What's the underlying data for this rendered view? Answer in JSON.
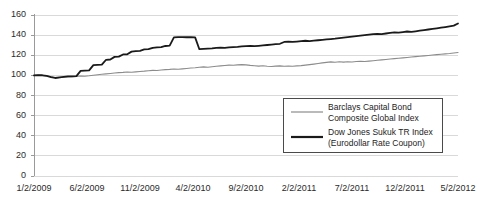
{
  "chart_data": {
    "type": "line",
    "title": "",
    "subtitle": "",
    "xlabel": "",
    "ylabel": "",
    "ylim": [
      0,
      160
    ],
    "ytick_labels": [
      "160",
      "140",
      "120",
      "100",
      "80",
      "60",
      "40",
      "20",
      "0"
    ],
    "ytick_values": [
      160,
      140,
      120,
      100,
      80,
      60,
      40,
      20,
      0
    ],
    "grid": true,
    "grid_axis": "y",
    "grid_color": "#d9d9d9",
    "legend_position": "bottom-right",
    "x_label_interval_months": 5,
    "xtick_labels": [
      "1/2/2009",
      "6/2/2009",
      "11/2/2009",
      "4/2/2010",
      "9/2/2010",
      "2/2/2011",
      "7/2/2011",
      "12/2/2011",
      "5/2/2012"
    ],
    "xtick_values": [
      0,
      5,
      10,
      15,
      20,
      25,
      30,
      35,
      40
    ],
    "x_start": "1/2/2009",
    "x_end": "5/2/2012",
    "x_range_months": [
      0,
      40
    ],
    "series": [
      {
        "name": "Barclays Capital Bond Composite Global Index",
        "color": "#8c8c8c",
        "width": 1.1,
        "values": [
          100.0,
          100.2,
          99.9,
          99.4,
          98.6,
          97.5,
          97.8,
          98.2,
          98.4,
          98.7,
          99.0,
          99.4,
          99.2,
          99.6,
          100.1,
          100.6,
          101.1,
          101.5,
          101.9,
          102.3,
          102.7,
          103.0,
          103.4,
          103.1,
          103.5,
          103.9,
          104.2,
          104.6,
          105.0,
          104.8,
          105.3,
          105.7,
          106.0,
          106.4,
          106.1,
          106.5,
          106.9,
          107.3,
          107.6,
          108.0,
          108.4,
          108.1,
          108.6,
          109.0,
          109.4,
          109.8,
          110.2,
          110.0,
          110.4,
          110.7,
          110.4,
          109.9,
          109.6,
          109.2,
          109.5,
          109.1,
          108.8,
          109.2,
          109.4,
          109.1,
          109.3,
          109.0,
          109.4,
          109.7,
          110.2,
          110.7,
          111.2,
          111.8,
          112.4,
          112.9,
          113.4,
          113.0,
          113.5,
          113.2,
          113.6,
          113.3,
          113.8,
          114.1,
          113.8,
          114.2,
          114.6,
          115.0,
          115.4,
          115.8,
          116.2,
          116.6,
          117.0,
          117.4,
          117.8,
          118.2,
          118.6,
          119.0,
          119.4,
          119.8,
          120.2,
          120.6,
          121.0,
          121.4,
          121.8,
          122.3,
          122.7
        ]
      },
      {
        "name": "Dow Jones Sukuk TR Index (Eurodollar Rate Coupon)",
        "color": "#1a1a1a",
        "width": 1.8,
        "values": [
          100.0,
          100.3,
          100.1,
          99.4,
          98.2,
          97.4,
          98.0,
          98.6,
          99.0,
          99.1,
          99.3,
          104.5,
          104.8,
          105.0,
          110.2,
          110.4,
          110.6,
          115.5,
          115.8,
          118.4,
          118.6,
          120.8,
          121.0,
          123.6,
          124.0,
          124.3,
          125.8,
          126.0,
          127.4,
          127.8,
          128.0,
          129.2,
          129.5,
          137.8,
          138.0,
          138.1,
          137.9,
          138.0,
          137.8,
          126.0,
          126.3,
          126.6,
          126.9,
          127.3,
          127.6,
          127.4,
          127.8,
          128.1,
          128.4,
          128.8,
          129.1,
          129.4,
          129.0,
          129.4,
          129.8,
          130.2,
          130.6,
          131.0,
          131.4,
          133.2,
          133.5,
          133.2,
          133.6,
          134.0,
          134.4,
          134.1,
          134.5,
          134.9,
          135.3,
          135.7,
          136.1,
          136.5,
          137.0,
          137.5,
          138.0,
          138.5,
          139.0,
          139.5,
          140.0,
          140.4,
          140.9,
          141.3,
          141.0,
          141.6,
          142.2,
          142.8,
          142.4,
          143.0,
          143.6,
          143.2,
          143.8,
          144.4,
          145.0,
          145.6,
          146.2,
          146.8,
          147.4,
          148.0,
          148.7,
          149.4,
          151.5
        ]
      }
    ]
  },
  "legend": {
    "entries": [
      {
        "label_line1": "Barclays Capital Bond",
        "label_line2": "Composite Global Index",
        "color": "#8c8c8c",
        "width": 1.1
      },
      {
        "label_line1": "Dow Jones Sukuk TR Index",
        "label_line2": "(Eurodollar Rate Coupon)",
        "color": "#1a1a1a",
        "width": 2.2
      }
    ]
  }
}
